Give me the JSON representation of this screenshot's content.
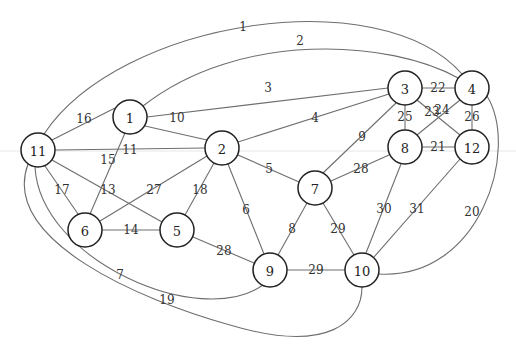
{
  "diagram": {
    "type": "undirected-weighted-graph",
    "node_radius": 17,
    "nodes": [
      {
        "id": "1",
        "x": 130,
        "y": 117
      },
      {
        "id": "2",
        "x": 222,
        "y": 148
      },
      {
        "id": "3",
        "x": 405,
        "y": 88
      },
      {
        "id": "4",
        "x": 472,
        "y": 88
      },
      {
        "id": "5",
        "x": 177,
        "y": 230
      },
      {
        "id": "6",
        "x": 85,
        "y": 230
      },
      {
        "id": "7",
        "x": 315,
        "y": 188
      },
      {
        "id": "8",
        "x": 405,
        "y": 147
      },
      {
        "id": "9",
        "x": 270,
        "y": 270
      },
      {
        "id": "10",
        "x": 362,
        "y": 270
      },
      {
        "id": "11",
        "x": 38,
        "y": 150
      },
      {
        "id": "12",
        "x": 472,
        "y": 147
      }
    ],
    "edges": [
      {
        "label": "1",
        "from": "11",
        "to": "4",
        "path": "M 44 134 C 120 20, 380 -20, 462 74",
        "lx": 243,
        "ly": 27
      },
      {
        "label": "2",
        "from": "1",
        "to": "4",
        "path": "M 143 106 C 240 30, 390 40, 458 78",
        "lx": 300,
        "ly": 41
      },
      {
        "label": "3",
        "from": "1",
        "to": "3",
        "path": "M 147 117 L 388 88",
        "lx": 268,
        "ly": 88
      },
      {
        "label": "4",
        "from": "2",
        "to": "3",
        "path": "M 238 142 L 389 94",
        "lx": 315,
        "ly": 118
      },
      {
        "label": "5",
        "from": "2",
        "to": "7",
        "path": "M 238 155 L 299 182",
        "lx": 269,
        "ly": 169
      },
      {
        "label": "6",
        "from": "2",
        "to": "9",
        "path": "M 228 164 L 264 254",
        "lx": 246,
        "ly": 210
      },
      {
        "label": "7",
        "from": "11",
        "to": "9",
        "path": "M 35 167 C 40 260, 200 330, 263 285",
        "lx": 120,
        "ly": 275
      },
      {
        "label": "8",
        "from": "7",
        "to": "9",
        "path": "M 307 203 L 278 255",
        "lx": 292,
        "ly": 229
      },
      {
        "label": "9",
        "from": "3",
        "to": "7",
        "path": "M 396 103 L 323 173",
        "lx": 362,
        "ly": 137
      },
      {
        "label": "10",
        "from": "1",
        "to": "2",
        "path": "M 145 126 L 207 140",
        "lx": 177,
        "ly": 118
      },
      {
        "label": "11",
        "from": "11",
        "to": "2",
        "path": "M 55 150 L 205 148",
        "lx": 130,
        "ly": 150
      },
      {
        "label": "13",
        "from": "11",
        "to": "5",
        "path": "M 52 160 L 162 222",
        "lx": 108,
        "ly": 190
      },
      {
        "label": "14",
        "from": "6",
        "to": "5",
        "path": "M 102 230 L 160 230",
        "lx": 131,
        "ly": 230
      },
      {
        "label": "15",
        "from": "1",
        "to": "6",
        "path": "M 125 133 L 90 214",
        "lx": 108,
        "ly": 160
      },
      {
        "label": "16",
        "from": "11",
        "to": "1",
        "path": "M 52 140 L 115 108",
        "lx": 84,
        "ly": 119
      },
      {
        "label": "17",
        "from": "11",
        "to": "6",
        "path": "M 45 166 L 78 214",
        "lx": 62,
        "ly": 190
      },
      {
        "label": "18",
        "from": "2",
        "to": "5",
        "path": "M 214 163 L 185 215",
        "lx": 200,
        "ly": 190
      },
      {
        "label": "19",
        "from": "11",
        "to": "10",
        "path": "M 28 164 C 0 240, 140 300, 230 325 C 330 355, 362 320, 362 287",
        "lx": 167,
        "ly": 300
      },
      {
        "label": "20",
        "from": "4",
        "to": "10",
        "path": "M 487 96 C 520 150, 480 280, 379 274",
        "lx": 472,
        "ly": 212
      },
      {
        "label": "21",
        "from": "8",
        "to": "12",
        "path": "M 422 147 L 455 147",
        "lx": 438,
        "ly": 147
      },
      {
        "label": "22",
        "from": "3",
        "to": "4",
        "path": "M 422 88 L 455 88",
        "lx": 438,
        "ly": 88
      },
      {
        "label": "23",
        "from": "3",
        "to": "12",
        "path": "M 417 100 L 460 135",
        "lx": 432,
        "ly": 112
      },
      {
        "label": "24",
        "from": "8",
        "to": "4",
        "path": "M 417 135 L 460 100",
        "lx": 442,
        "ly": 110
      },
      {
        "label": "25",
        "from": "3",
        "to": "8",
        "path": "M 405 105 L 405 130",
        "lx": 405,
        "ly": 117
      },
      {
        "label": "26",
        "from": "4",
        "to": "12",
        "path": "M 472 105 L 472 130",
        "lx": 472,
        "ly": 117
      },
      {
        "label": "27",
        "from": "2",
        "to": "6",
        "path": "M 207 156 L 100 221",
        "lx": 154,
        "ly": 190
      },
      {
        "label": "28",
        "from": "7",
        "to": "8",
        "path": "M 331 181 L 389 155",
        "lx": 361,
        "ly": 169
      },
      {
        "label": "28",
        "from": "5",
        "to": "9",
        "path": "M 193 237 L 254 263",
        "lx": 224,
        "ly": 251
      },
      {
        "label": "29",
        "from": "7",
        "to": "10",
        "path": "M 323 203 L 354 255",
        "lx": 338,
        "ly": 229
      },
      {
        "label": "29",
        "from": "9",
        "to": "10",
        "path": "M 287 270 L 345 270",
        "lx": 316,
        "ly": 270
      },
      {
        "label": "30",
        "from": "8",
        "to": "10",
        "path": "M 401 164 L 366 253",
        "lx": 384,
        "ly": 209
      },
      {
        "label": "31",
        "from": "12",
        "to": "10",
        "path": "M 460 159 L 374 257",
        "lx": 417,
        "ly": 209
      }
    ]
  }
}
